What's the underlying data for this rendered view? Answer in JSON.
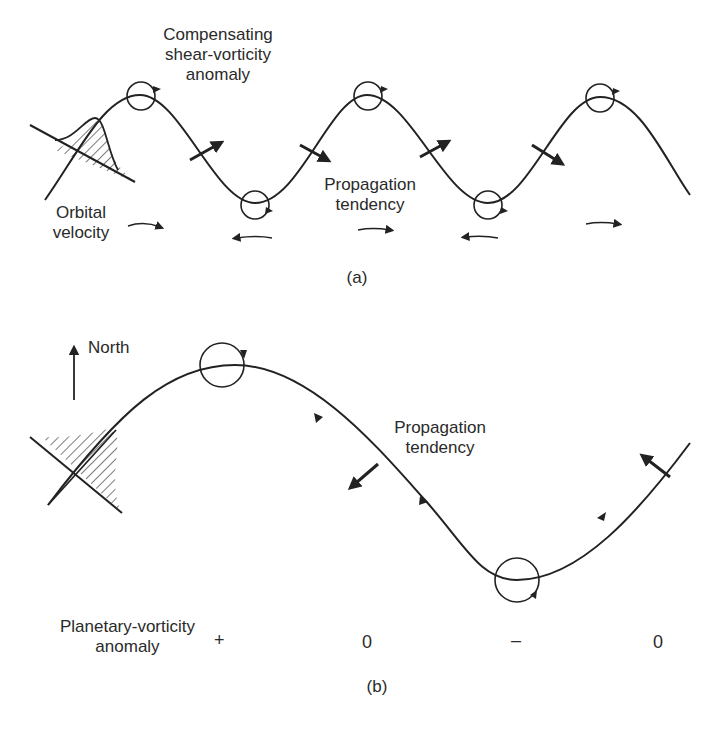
{
  "panel_a": {
    "caption": "(a)",
    "labels": {
      "compensating": [
        "Compensating",
        "shear-vorticity",
        "anomaly"
      ],
      "propagation": [
        "Propagation",
        "tendency"
      ],
      "orbital": [
        "Orbital",
        "velocity"
      ]
    }
  },
  "panel_b": {
    "caption": "(b)",
    "north_label": "North",
    "propagation": [
      "Propagation",
      "tendency"
    ],
    "planetary_label": [
      "Planetary-vorticity",
      "anomaly"
    ],
    "anomaly_signs": [
      "+",
      "0",
      "–",
      "0"
    ]
  },
  "colors": {
    "ink": "#222222",
    "background": "#ffffff"
  }
}
